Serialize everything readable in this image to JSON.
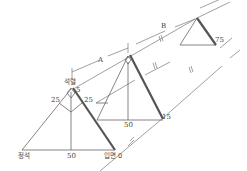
{
  "diagram": {
    "labels": {
      "A": "A",
      "B": "B",
      "top_apex": "석렬",
      "bottom_left": "정석",
      "bottom_right": "입면 0",
      "left_base_mid": "50",
      "left_side_25": "25",
      "right_side_25": "25",
      "apex_5": "5",
      "mid_base_50": "50",
      "mid_right_15": "15",
      "small_right_75": "75"
    },
    "colors": {
      "line": "#666666",
      "thick_line": "#555555",
      "background": "#ffffff"
    }
  }
}
